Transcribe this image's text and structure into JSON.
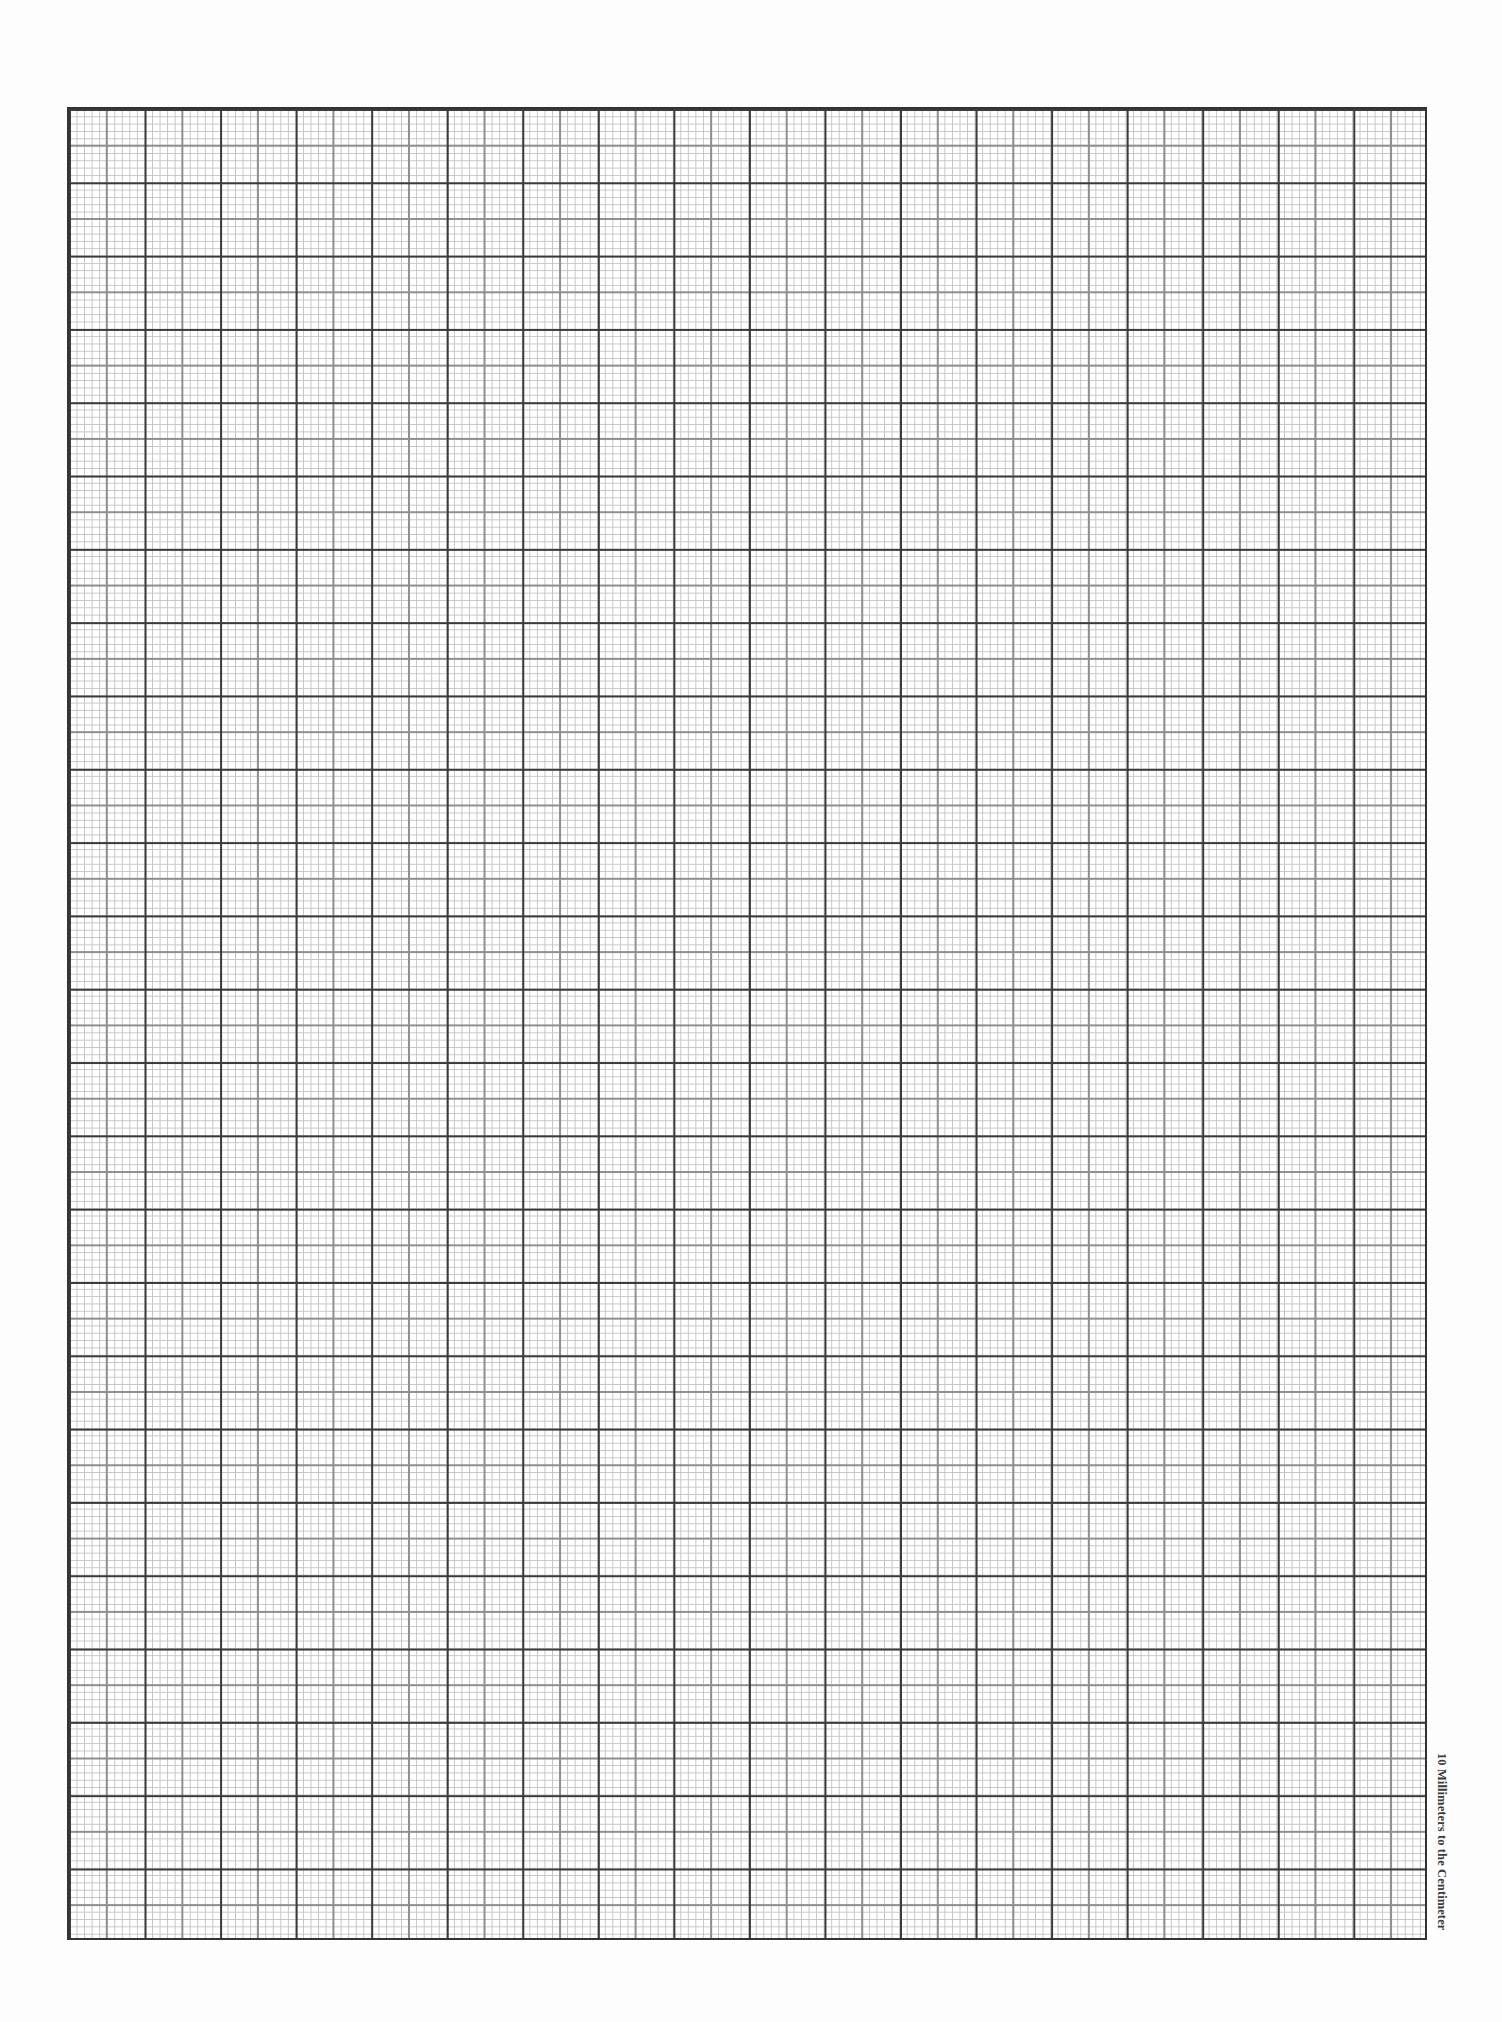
{
  "page": {
    "type": "graph paper sheet",
    "background_color": "#ffffff"
  },
  "grid": {
    "columns_cm": 18,
    "rows_cm": 25,
    "subdivisions_per_cm": 10,
    "medium_line_every_mm": 5,
    "colors": {
      "border": "#333333",
      "major_line": "#3a3a3a",
      "medium_line": "#8f8f8f",
      "minor_line": "#c4c4c4"
    }
  },
  "labels": {
    "scale_note": "10 Millimeters to the Centimeter"
  }
}
